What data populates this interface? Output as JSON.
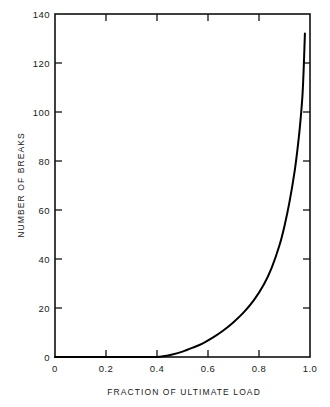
{
  "chart_data": {
    "type": "line",
    "title": "",
    "xlabel": "FRACTION  OF  ULTIMATE LOAD",
    "ylabel": "NUMBER OF BREAKS",
    "xlim": [
      0,
      1.0
    ],
    "ylim": [
      0,
      140
    ],
    "grid": false,
    "legend": null,
    "x_ticks": [
      0,
      0.2,
      0.4,
      0.6,
      0.8,
      1.0
    ],
    "x_tick_labels": [
      "0",
      "0.2",
      "0.4",
      "0.6",
      "0.8",
      "1.0"
    ],
    "y_ticks": [
      0,
      20,
      40,
      60,
      80,
      100,
      120,
      140
    ],
    "y_tick_labels": [
      "0",
      "20",
      "40",
      "60",
      "80",
      "100",
      "120",
      "140"
    ],
    "line_color": "#000000",
    "line_width": 2.0,
    "frame_color": "#000000",
    "background": "#ffffff",
    "series": [
      {
        "name": "breaks",
        "x": [
          0.0,
          0.1,
          0.2,
          0.3,
          0.35,
          0.4,
          0.43,
          0.46,
          0.5,
          0.54,
          0.58,
          0.62,
          0.66,
          0.7,
          0.74,
          0.78,
          0.82,
          0.85,
          0.88,
          0.9,
          0.92,
          0.94,
          0.95,
          0.96,
          0.97,
          0.975,
          0.98
        ],
        "y": [
          0.0,
          0.0,
          0.0,
          0.0,
          0.0,
          0.0,
          0.4,
          1.0,
          2.2,
          3.8,
          5.6,
          8.0,
          10.8,
          14.2,
          18.2,
          23.2,
          29.8,
          36.5,
          45.5,
          53.5,
          63.5,
          76.0,
          84.0,
          93.5,
          106.0,
          117.0,
          132.0
        ]
      }
    ]
  },
  "axes": {
    "x_label": "FRACTION  OF  ULTIMATE LOAD",
    "y_label": "NUMBER OF BREAKS",
    "x_tick_labels": [
      "0",
      "0.2",
      "0.4",
      "0.6",
      "0.8",
      "1.0"
    ],
    "y_tick_labels": [
      "0",
      "20",
      "40",
      "60",
      "80",
      "100",
      "120",
      "140"
    ]
  }
}
